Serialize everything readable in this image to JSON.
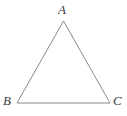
{
  "figure": {
    "name": "triangle-abc",
    "type": "geometry-diagram",
    "background_color": "#ffffff",
    "stroke_color": "#8a8a8a",
    "label_color": "#3a3a3a",
    "stroke_width": 1,
    "canvas": {
      "width": 127,
      "height": 116
    },
    "shape": {
      "kind": "triangle",
      "closed": true,
      "points_attr": "63.5,21 17,103 110,103",
      "vertices": [
        {
          "id": "A",
          "label": "A",
          "x": 63.5,
          "y": 21
        },
        {
          "id": "B",
          "label": "B",
          "x": 17,
          "y": 103
        },
        {
          "id": "C",
          "label": "C",
          "x": 110,
          "y": 103
        }
      ],
      "edges": [
        {
          "from": "A",
          "to": "B"
        },
        {
          "from": "B",
          "to": "C"
        },
        {
          "from": "C",
          "to": "A"
        }
      ]
    },
    "labels": {
      "apex": "A",
      "bottom_left": "B",
      "bottom_right": "C"
    }
  }
}
